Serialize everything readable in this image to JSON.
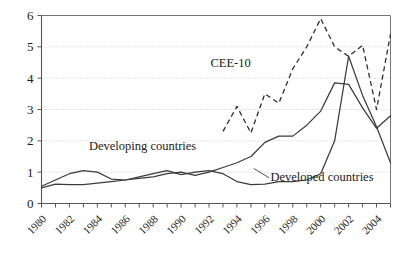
{
  "chart_data": {
    "type": "line",
    "title": "",
    "xlabel": "",
    "ylabel": "",
    "xlim": [
      1980,
      2005
    ],
    "ylim": [
      0,
      6
    ],
    "grid": true,
    "legend_position": "inline-annotations",
    "ytick_labels": [
      "0",
      "1",
      "2",
      "3",
      "4",
      "5",
      "6"
    ],
    "ytick_values": [
      0,
      1,
      2,
      3,
      4,
      5,
      6
    ],
    "xtick_labels": [
      "1980",
      "1982",
      "1984",
      "1986",
      "1988",
      "1990",
      "1992",
      "1994",
      "1996",
      "1998",
      "2000",
      "2002",
      "2004"
    ],
    "xtick_values": [
      1980,
      1982,
      1984,
      1986,
      1988,
      1990,
      1992,
      1994,
      1996,
      1998,
      2000,
      2002,
      2004
    ],
    "x_minor_ticks": [
      1981,
      1983,
      1985,
      1987,
      1989,
      1991,
      1993,
      1995,
      1997,
      1999,
      2001,
      2003,
      2005
    ],
    "series": [
      {
        "name": "CEE-10",
        "style": "dashed",
        "color": "#2e2e2e",
        "label": "CEE-10",
        "label_x": 1992.1,
        "label_y": 4.35,
        "x": [
          1993,
          1994,
          1995,
          1996,
          1997,
          1998,
          1999,
          2000,
          2001,
          2002,
          2003,
          2004,
          2005
        ],
        "values": [
          2.3,
          3.1,
          2.25,
          3.5,
          3.2,
          4.3,
          5.0,
          5.9,
          5.0,
          4.7,
          5.05,
          3.0,
          5.4
        ]
      },
      {
        "name": "Developing countries",
        "style": "solid",
        "color": "#3b3b3b",
        "label": "Developing countries",
        "label_x": 1983.4,
        "label_y": 1.72,
        "x": [
          1980,
          1981,
          1982,
          1983,
          1984,
          1985,
          1986,
          1987,
          1988,
          1989,
          1990,
          1991,
          1992,
          1993,
          1994,
          1995,
          1996,
          1997,
          1998,
          1999,
          2000,
          2001,
          2002,
          2003,
          2004,
          2005
        ],
        "values": [
          0.55,
          0.75,
          0.95,
          1.05,
          1.0,
          0.78,
          0.75,
          0.8,
          0.85,
          0.95,
          1.0,
          0.9,
          1.0,
          1.15,
          1.3,
          1.5,
          1.95,
          2.15,
          2.15,
          2.5,
          2.95,
          3.85,
          3.8,
          3.05,
          2.4,
          2.8
        ]
      },
      {
        "name": "Developed countries",
        "style": "solid",
        "color": "#3b3b3b",
        "label": "Developed countries",
        "label_x": 1996.4,
        "label_y": 0.72,
        "x": [
          1980,
          1981,
          1982,
          1983,
          1984,
          1985,
          1986,
          1987,
          1988,
          1989,
          1990,
          1991,
          1992,
          1993,
          1994,
          1995,
          1996,
          1997,
          1998,
          1999,
          2000,
          2001,
          2002,
          2003,
          2004,
          2005
        ],
        "values": [
          0.5,
          0.62,
          0.6,
          0.6,
          0.65,
          0.7,
          0.75,
          0.85,
          0.95,
          1.05,
          0.92,
          1.0,
          1.05,
          0.95,
          0.7,
          0.6,
          0.62,
          0.7,
          0.7,
          0.75,
          0.95,
          2.0,
          4.7,
          3.45,
          2.45,
          1.3
        ]
      }
    ]
  }
}
